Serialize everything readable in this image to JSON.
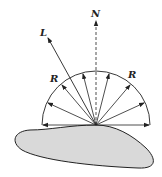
{
  "diagram": {
    "labels": {
      "light": "L",
      "normal": "N",
      "reflected_left": "R",
      "reflected_right": "R"
    },
    "colors": {
      "stroke": "#222222",
      "surface_fill": "#d9d9d9",
      "background": "#ffffff"
    },
    "origin": {
      "x": 96,
      "y": 125
    },
    "radius": 54,
    "reflected_ray_angles_deg": [
      180,
      155,
      130,
      105,
      75,
      50,
      25,
      0
    ]
  }
}
